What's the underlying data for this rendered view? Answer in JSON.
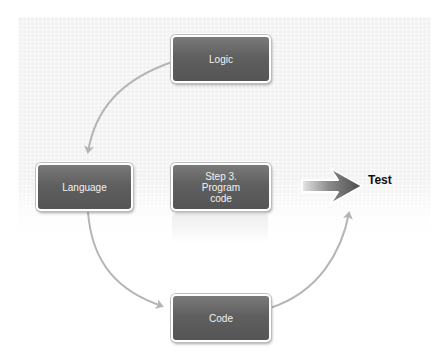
{
  "diagram": {
    "type": "cycle",
    "nodes": [
      {
        "id": "logic",
        "label": "Logic"
      },
      {
        "id": "language",
        "label": "Language"
      },
      {
        "id": "program_code",
        "label": "Step 3.\nProgram\ncode"
      },
      {
        "id": "code",
        "label": "Code"
      }
    ],
    "edges": [
      {
        "from": "logic",
        "to": "language"
      },
      {
        "from": "language",
        "to": "code"
      },
      {
        "from": "code",
        "to": "test_arrow"
      },
      {
        "from": "program_code",
        "to": "test"
      }
    ],
    "output": {
      "label": "Test"
    },
    "colors": {
      "box_fill": "#5f5f5f",
      "box_border": "#ffffff",
      "box_text": "#f2f2f2",
      "connector": "#b5b5b5",
      "big_arrow": "#555555",
      "panel": "#f1f1f1"
    }
  }
}
